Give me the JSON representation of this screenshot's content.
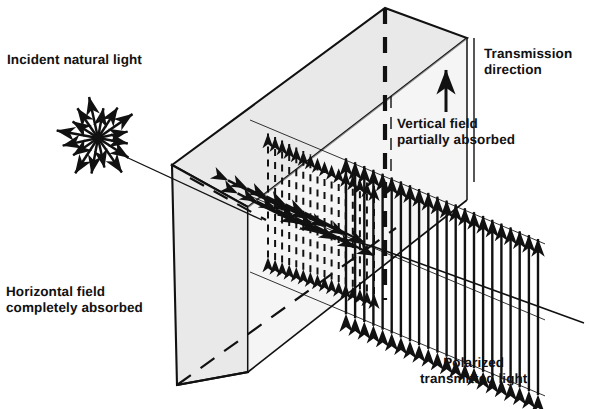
{
  "figure": {
    "type": "physics-diagram",
    "background_color": "#ffffff",
    "ink_color": "#111111",
    "slab_fill_color": "#e9e9e9",
    "slab_edge_color": "#111111"
  },
  "labels": {
    "incident": "Incident natural light",
    "transmission": "Transmission\ndirection",
    "vertical_absorbed": "Vertical field\npartially absorbed",
    "horizontal_absorbed": "Horizontal field\ncompletely absorbed",
    "polarized_out": "Polarized\ntransmitted light"
  },
  "elements": {
    "starburst": {
      "name": "unpolarized-light-starburst",
      "center_x": 98,
      "center_y": 138,
      "ray_count": 16,
      "radius": 42,
      "description": "radial double-headed arrows representing randomly oriented E-field vectors"
    },
    "polarizer_slab": {
      "name": "polarizing-sheet",
      "shape": "parallelepiped",
      "front_face": [
        [
          172,
          165
        ],
        [
          248,
          207
        ],
        [
          248,
          372
        ],
        [
          177,
          385
        ]
      ],
      "top_face": [
        [
          172,
          165
        ],
        [
          385,
          8
        ],
        [
          467,
          38
        ],
        [
          248,
          207
        ]
      ],
      "apex_top": [
        385,
        8
      ],
      "corner_right_top": [
        467,
        38
      ],
      "hidden_edges": "dashed"
    },
    "transmission_axis": {
      "name": "transmission-axis-dashed-line",
      "x": 385,
      "y_start": 8,
      "y_end": 300,
      "style": "thick-dashed-vertical"
    },
    "transmission_arrow": {
      "name": "transmission-direction-arrow",
      "x": 446,
      "y_tail": 110,
      "y_head": 68
    },
    "incident_ray": {
      "name": "incident-ray-line",
      "from": [
        128,
        158
      ],
      "to": [
        258,
        218
      ]
    },
    "exit_ray": {
      "name": "exit-ray-line",
      "from": [
        400,
        255
      ],
      "to": [
        582,
        322
      ]
    },
    "inside_field": {
      "name": "attenuated-field-arrows",
      "style": "dashed double-headed vertical arrows plus diagonal horizontal-component arrows",
      "count": 16
    },
    "output_field": {
      "name": "polarized-beam-arrows",
      "style": "solid double-headed vertical arrows, uniform length",
      "count": 22,
      "orientation": "vertical"
    }
  }
}
